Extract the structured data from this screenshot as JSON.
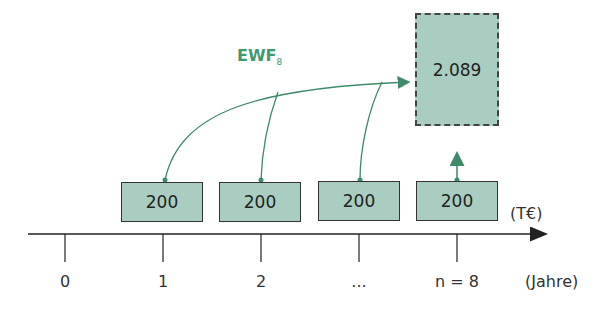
{
  "diagram": {
    "future_value": {
      "label": "2.089"
    },
    "factor_label": {
      "main": "EWF",
      "sub": "8"
    },
    "payments": [
      {
        "label": "200",
        "year": "1"
      },
      {
        "label": "200",
        "year": "2"
      },
      {
        "label": "200",
        "year": "..."
      },
      {
        "label": "200",
        "year": "n = 8"
      }
    ],
    "axis": {
      "ticks": [
        "0",
        "1",
        "2",
        "...",
        "n = 8"
      ],
      "unit_amount": "(T€)",
      "unit_time": "(Jahre)"
    },
    "colors": {
      "box_fill": "#a9cdc0",
      "arrow": "#3f8a68",
      "label": "#3f9a72"
    }
  }
}
